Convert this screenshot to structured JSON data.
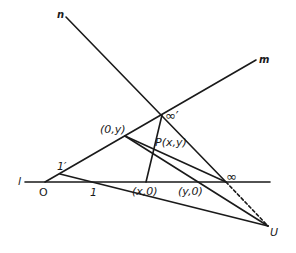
{
  "diagram": {
    "type": "projective-coordinate-construction",
    "colors": {
      "ink": "#1a1a1a",
      "background": "#ffffff"
    },
    "lines": {
      "l": {
        "label": "l"
      },
      "m": {
        "label": "m"
      },
      "n": {
        "label": "n"
      }
    },
    "points": {
      "O": {
        "label": "O"
      },
      "one": {
        "label": "1"
      },
      "one_prime": {
        "label": "1′"
      },
      "x0": {
        "label": "(x,0)"
      },
      "y0": {
        "label": "(y,0)"
      },
      "inf": {
        "label": "∞"
      },
      "inf_prime": {
        "label": "∞′"
      },
      "zero_y": {
        "label": "(0,y)"
      },
      "P": {
        "label": "P(x,y)"
      },
      "U": {
        "label": "U"
      }
    }
  }
}
